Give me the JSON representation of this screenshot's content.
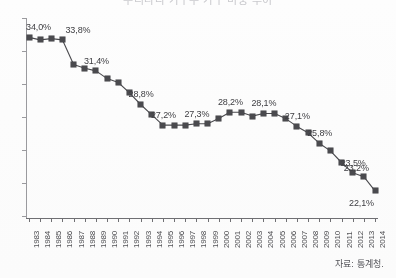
{
  "title": {
    "text": "우리나라 가구주 가구 비중 추이"
  },
  "source": {
    "label": "자료: 통계청."
  },
  "chart_data": {
    "type": "line",
    "title": "우리나라 가구주 가구 비중 추이",
    "xlabel": "",
    "ylabel": "",
    "grid": false,
    "legend": null,
    "ylim": [
      20.0,
      35.5
    ],
    "yticks_labeled": false,
    "ytick_count": 7,
    "marker": "square",
    "series_color": "#4a4a4e",
    "categories": [
      "1983",
      "1984",
      "1985",
      "1986",
      "1987",
      "1988",
      "1989",
      "1990",
      "1991",
      "1992",
      "1993",
      "1994",
      "1995",
      "1996",
      "1997",
      "1998",
      "1999",
      "2000",
      "2001",
      "2002",
      "2003",
      "2004",
      "2005",
      "2006",
      "2007",
      "2008",
      "2009",
      "2010",
      "2011",
      "2012",
      "2013",
      "2014"
    ],
    "values": [
      34.0,
      33.8,
      33.9,
      33.8,
      31.9,
      31.6,
      31.4,
      30.8,
      30.5,
      29.7,
      28.8,
      28.0,
      27.2,
      27.2,
      27.2,
      27.3,
      27.3,
      27.7,
      28.2,
      28.2,
      27.9,
      28.1,
      28.1,
      27.7,
      27.1,
      26.6,
      25.8,
      25.2,
      24.3,
      23.5,
      23.2,
      22.1
    ],
    "labels": [
      {
        "category": "1983",
        "value": 34.0,
        "text": "34,0%"
      },
      {
        "category": "1986",
        "value": 33.8,
        "text": "33,8%"
      },
      {
        "category": "1989",
        "value": 31.4,
        "text": "31,4%"
      },
      {
        "category": "1993",
        "value": 28.8,
        "text": "28,8%"
      },
      {
        "category": "1995",
        "value": 27.2,
        "text": "27,2%"
      },
      {
        "category": "1998",
        "value": 27.3,
        "text": "27,3%"
      },
      {
        "category": "2001",
        "value": 28.2,
        "text": "28,2%"
      },
      {
        "category": "2004",
        "value": 28.1,
        "text": "28,1%"
      },
      {
        "category": "2007",
        "value": 27.1,
        "text": "27,1%"
      },
      {
        "category": "2009",
        "value": 25.8,
        "text": "25,8%"
      },
      {
        "category": "2012",
        "value": 23.5,
        "text": "23,5%"
      },
      {
        "category": "2013",
        "value": 23.2,
        "text": "23,2%"
      },
      {
        "category": "2014",
        "value": 22.1,
        "text": "22,1%"
      }
    ]
  }
}
